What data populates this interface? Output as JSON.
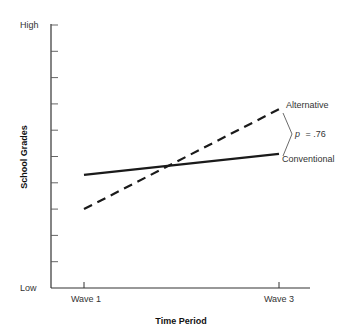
{
  "chart_data": {
    "type": "line",
    "title": "",
    "xlabel": "Time Period",
    "ylabel": "School Grades",
    "categories": [
      "Wave 1",
      "Wave 3"
    ],
    "y_tick_labels": {
      "top": "High",
      "bottom": "Low"
    },
    "ylim": [
      0,
      10
    ],
    "y_tick_count": 11,
    "grid": false,
    "legend_position": "inline-right",
    "series": [
      {
        "name": "Alternative",
        "style": "dashed",
        "values": [
          3.0,
          6.8
        ]
      },
      {
        "name": "Conventional",
        "style": "solid",
        "values": [
          4.3,
          5.1
        ]
      }
    ],
    "annotations": [
      {
        "text": "p = .76",
        "type": "bracket",
        "between": [
          "Alternative",
          "Conventional"
        ],
        "at": "Wave 3"
      }
    ]
  },
  "labels": {
    "y_high": "High",
    "y_low": "Low",
    "y_title": "School Grades",
    "x_title": "Time Period",
    "x_wave1": "Wave 1",
    "x_wave3": "Wave 3",
    "series_alternative": "Alternative",
    "series_conventional": "Conventional",
    "p_italic": "p",
    "p_value": "= .76"
  }
}
